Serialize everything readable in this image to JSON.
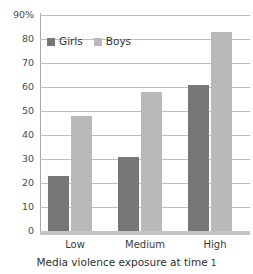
{
  "chart_data": {
    "type": "bar",
    "title": "",
    "xlabel": "Media violence exposure at time 1",
    "ylabel": "",
    "categories": [
      "Low",
      "Medium",
      "High"
    ],
    "series": [
      {
        "name": "Girls",
        "color": "#767676",
        "values": [
          23,
          31,
          61
        ]
      },
      {
        "name": "Boys",
        "color": "#b9b9b9",
        "values": [
          48,
          58,
          83
        ]
      }
    ],
    "ylim": [
      0,
      90
    ],
    "ytick_step": 10,
    "ytick_labels": [
      "90%",
      "80",
      "70",
      "60",
      "50",
      "40",
      "30",
      "20",
      "10",
      "0"
    ],
    "ytick_values": [
      90,
      80,
      70,
      60,
      50,
      40,
      30,
      20,
      10,
      0
    ],
    "grid": "horizontal",
    "legend_position": "inside-top-left"
  },
  "axis": {
    "title": "Media violence exposure at time",
    "title_trailing_numeral": "1"
  }
}
